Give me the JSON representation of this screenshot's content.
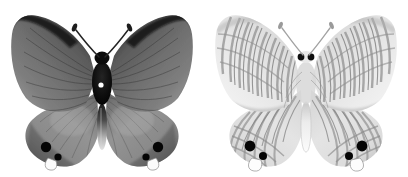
{
  "plate": {
    "title": "Butterfly specimen plate",
    "background_color": "#ffffff",
    "width": 408,
    "height": 177,
    "specimen_count": 2,
    "subject": "butterfly",
    "family_appearance": "lycaenid",
    "image_mode": "grayscale"
  },
  "specimens": [
    {
      "id": "dorsal",
      "view_label": "dorsal",
      "position": "left",
      "wing_upperside_color": "#6e6e6e",
      "wing_margin_color": "#1a1a1a",
      "wing_apex_color": "#151515",
      "hindwing_color": "#8f8f8f",
      "body_color": "#111111",
      "abdomen_color": "#d8d8d8",
      "thorax_spot_color": "#ffffff",
      "antenna_color": "#2b2b2b",
      "eyespot_color": "#050505",
      "eyespot_count": 4,
      "tail_color": "#f2f2f2",
      "tail_count": 2,
      "vein_color": "#3a3a3a",
      "pattern": "plain graded wash with dark costal and outer margins, fine radiating veins"
    },
    {
      "id": "ventral",
      "view_label": "ventral",
      "position": "right",
      "wing_underside_color": "#dedede",
      "band_color": "#8d8d8d",
      "band_dark_color": "#6a6a6a",
      "wing_margin_color": "#9a9a9a",
      "body_color": "#cfcfcf",
      "head_eye_color": "#101010",
      "abdomen_color": "#f0f0f0",
      "antenna_color": "#9a9a9a",
      "eyespot_color": "#050505",
      "eyespot_count": 4,
      "tail_color": "#fafafa",
      "tail_count": 2,
      "pattern": "pale ground crossed by many wavy transverse striae and bands"
    }
  ],
  "palette": {
    "white": "#ffffff",
    "near_black": "#0a0a0a",
    "dark_gray": "#333333",
    "mid_gray": "#777777",
    "light_gray": "#c6c6c6",
    "pale_gray": "#e6e6e6"
  }
}
